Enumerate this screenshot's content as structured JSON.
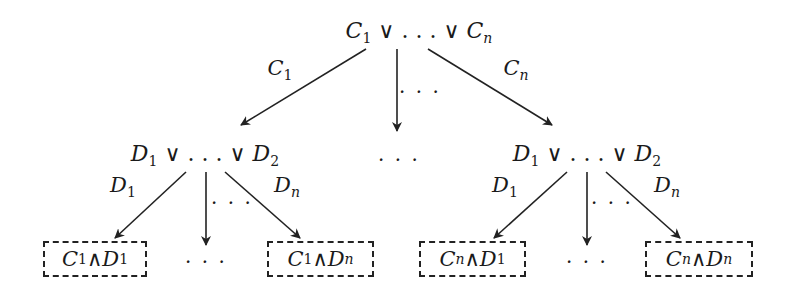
{
  "diagram": {
    "type": "tree",
    "root": {
      "label": "C1 ∨ … ∨ Cn",
      "parts": [
        "C",
        "1",
        " ∨ . . . ∨ ",
        "C",
        "n"
      ]
    },
    "level1_edges": [
      {
        "label_var": "C",
        "label_sub": "1"
      },
      {
        "label": "…"
      },
      {
        "label_var": "C",
        "label_sub": "n"
      }
    ],
    "level1_nodes": [
      {
        "label": "D1 ∨ … ∨ D2",
        "parts": [
          "D",
          "1",
          " ∨ . . . ∨ ",
          "D",
          "2"
        ]
      },
      {
        "label": "…"
      },
      {
        "label": "D1 ∨ … ∨ D2",
        "parts": [
          "D",
          "1",
          " ∨ . . . ∨ ",
          "D",
          "2"
        ]
      }
    ],
    "level2_edges_left": [
      {
        "label_var": "D",
        "label_sub": "1"
      },
      {
        "label": "…"
      },
      {
        "label_var": "D",
        "label_sub": "n"
      }
    ],
    "level2_edges_right": [
      {
        "label_var": "D",
        "label_sub": "1"
      },
      {
        "label": "…"
      },
      {
        "label_var": "D",
        "label_sub": "n"
      }
    ],
    "leaves": [
      {
        "label": "C1 ∧ D1",
        "c": "C",
        "cs": "1",
        "op": " ∧ ",
        "d": "D",
        "ds": "1"
      },
      {
        "label": "…"
      },
      {
        "label": "C1 ∧ Dn",
        "c": "C",
        "cs": "1",
        "op": " ∧ ",
        "d": "D",
        "ds": "n"
      },
      {
        "label": "Cn ∧ D1",
        "c": "C",
        "cs": "n",
        "op": " ∧ ",
        "d": "D",
        "ds": "1"
      },
      {
        "label": "…"
      },
      {
        "label": "Cn ∧ Dn",
        "c": "C",
        "cs": "n",
        "op": " ∧ ",
        "d": "D",
        "ds": "n"
      }
    ],
    "ellipsis": "· · ·",
    "colors": {
      "stroke": "#222222",
      "background": "#ffffff"
    }
  }
}
